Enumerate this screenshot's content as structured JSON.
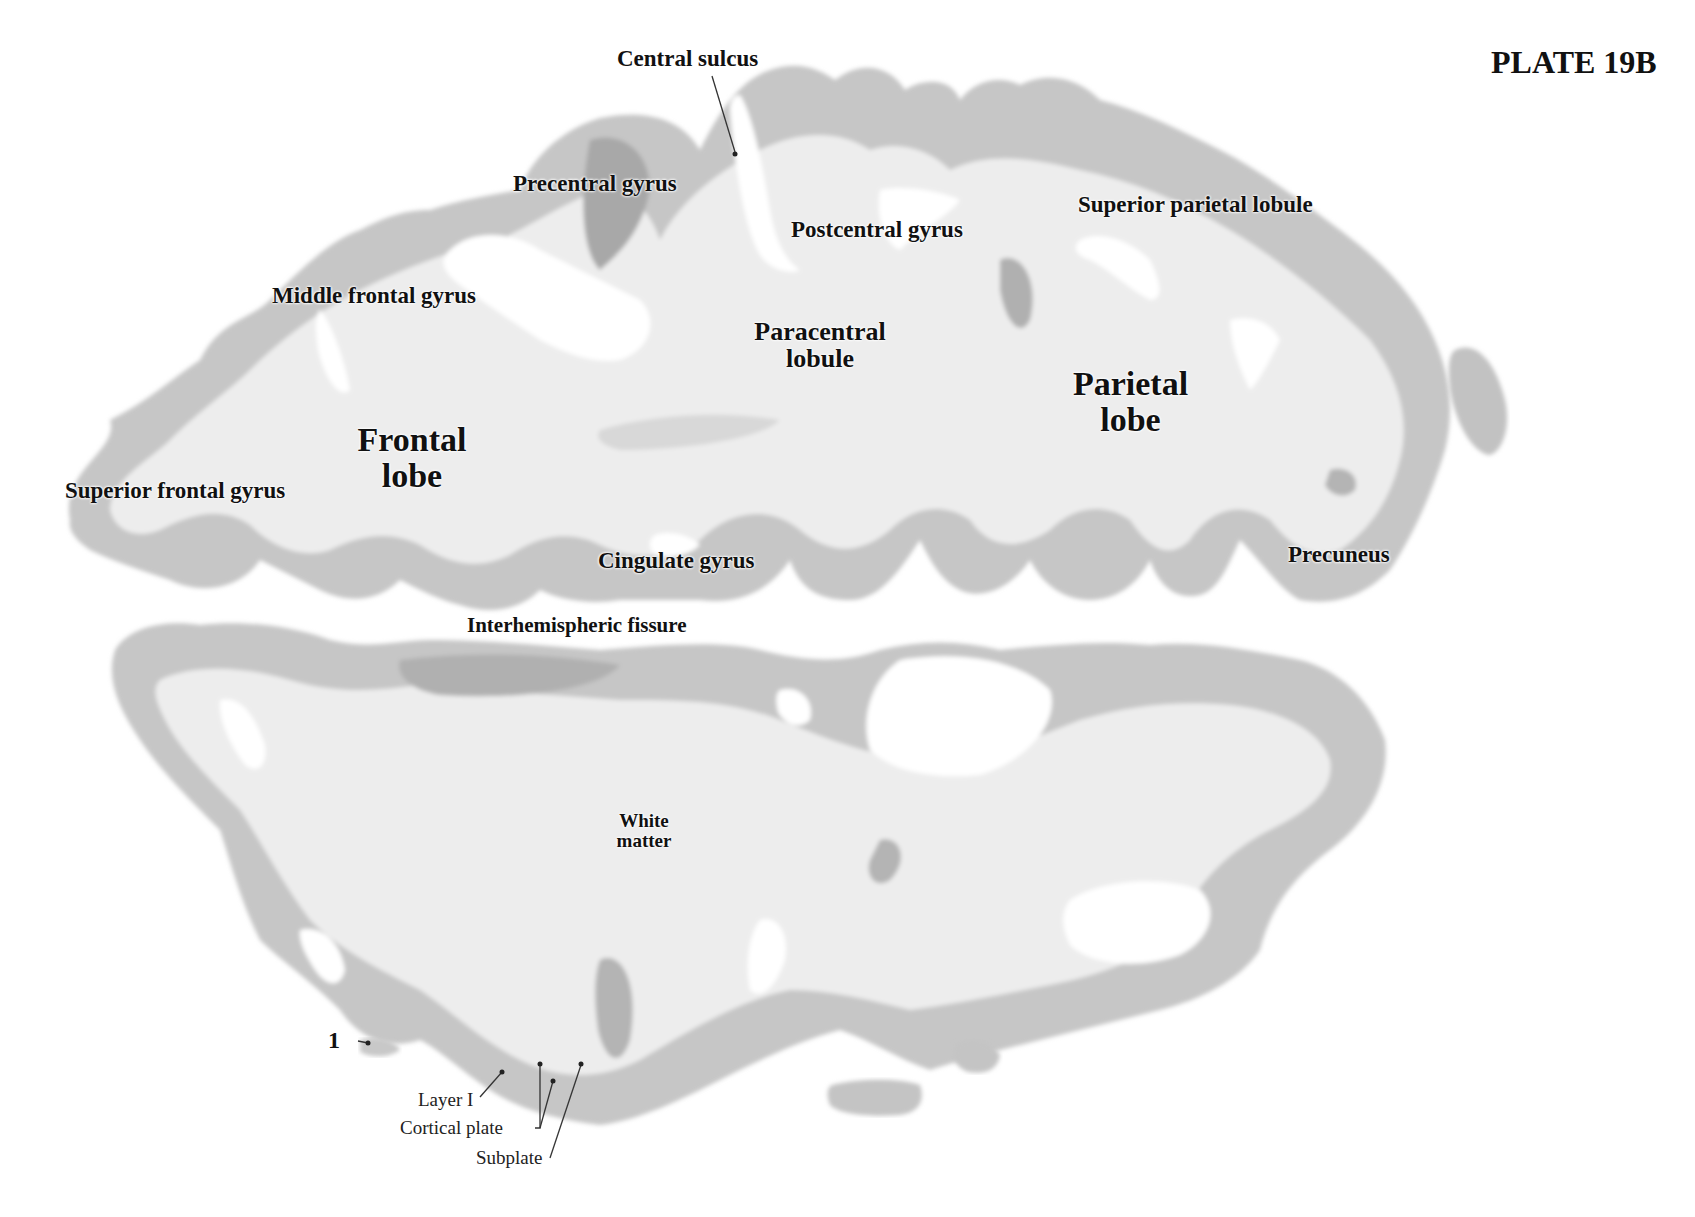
{
  "plate": {
    "title": "PLATE 19B"
  },
  "labels": {
    "central_sulcus": "Central sulcus",
    "precentral_gyrus": "Precentral gyrus",
    "postcentral_gyrus": "Postcentral gyrus",
    "superior_parietal_lobule": "Superior parietal lobule",
    "middle_frontal_gyrus": "Middle frontal gyrus",
    "paracentral_lobule_line1": "Paracentral",
    "paracentral_lobule_line2": "lobule",
    "parietal_lobe_line1": "Parietal",
    "parietal_lobe_line2": "lobe",
    "frontal_lobe_line1": "Frontal",
    "frontal_lobe_line2": "lobe",
    "superior_frontal_gyrus": "Superior frontal gyrus",
    "cingulate_gyrus": "Cingulate gyrus",
    "precuneus": "Precuneus",
    "interhemispheric_fissure": "Interhemispheric fissure",
    "white_matter_line1": "White",
    "white_matter_line2": "matter",
    "marker_1": "1",
    "layer_i": "Layer I",
    "cortical_plate": "Cortical plate",
    "subplate": "Subplate"
  },
  "colors": {
    "background": "#ffffff",
    "white_matter": "#eeeeee",
    "cortex": "#c4c4c4",
    "cortex_dark": "#a9a9a9",
    "text": "#111111",
    "leader_line": "#333333"
  }
}
